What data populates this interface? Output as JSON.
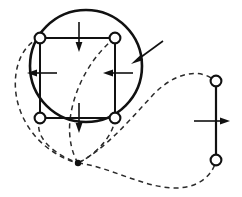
{
  "figure": {
    "canvas": {
      "width": 242,
      "height": 197,
      "background": "#ffffff"
    },
    "colors": {
      "solid_line": "#111111",
      "dashed_line": "#2b2b2b",
      "node_fill": "#ffffff",
      "junction": "#111111"
    },
    "left_assembly": {
      "label": "four-bar square linkage inside circle",
      "circle": {
        "cx": 86,
        "cy": 66,
        "r": 56,
        "stroke_width": 2.6
      },
      "square": {
        "x": 40,
        "y": 38,
        "width": 75,
        "height": 80,
        "stroke_width": 2.0
      },
      "nodes": [
        {
          "name": "top-left",
          "cx": 40,
          "cy": 38,
          "r": 5.4
        },
        {
          "name": "top-right",
          "cx": 115,
          "cy": 38,
          "r": 5.4
        },
        {
          "name": "bottom-left",
          "cx": 40,
          "cy": 118,
          "r": 5.4
        },
        {
          "name": "bottom-right",
          "cx": 115,
          "cy": 118,
          "r": 5.4
        }
      ],
      "force_arrows": [
        {
          "name": "top-vertical-down",
          "direction": "down",
          "x1": 79,
          "y1": 22,
          "x2": 79,
          "y2": 51
        },
        {
          "name": "bottom-vertical-down",
          "direction": "down",
          "x1": 79,
          "y1": 103,
          "x2": 79,
          "y2": 132
        },
        {
          "name": "left-horizontal-left",
          "direction": "left",
          "x1": 57,
          "y1": 73,
          "x2": 28,
          "y2": 73
        },
        {
          "name": "right-horizontal-left",
          "direction": "left",
          "x1": 133,
          "y1": 73,
          "x2": 104,
          "y2": 73
        }
      ],
      "tick_marks": [
        {
          "name": "top-arrow-tick",
          "orientation": "horizontal",
          "cx": 79,
          "cy": 38,
          "len": 30
        },
        {
          "name": "bottom-arrow-tick",
          "orientation": "horizontal",
          "cx": 79,
          "cy": 118,
          "len": 30
        },
        {
          "name": "left-arrow-tick",
          "orientation": "vertical",
          "cx": 40,
          "cy": 73,
          "len": 28
        },
        {
          "name": "right-arrow-tick",
          "orientation": "vertical",
          "cx": 115,
          "cy": 73,
          "len": 28
        }
      ],
      "leader_arrow": {
        "name": "circle-leader-arrow",
        "direction": "down-left",
        "x1": 163,
        "y1": 41,
        "x2": 132,
        "y2": 63
      }
    },
    "right_assembly": {
      "label": "two-node vertical link",
      "link": {
        "x": 216,
        "y1": 81,
        "y2": 160,
        "stroke_width": 2.0
      },
      "nodes": [
        {
          "name": "upper",
          "cx": 216,
          "cy": 81,
          "r": 5.4
        },
        {
          "name": "lower",
          "cx": 216,
          "cy": 160,
          "r": 5.4
        }
      ],
      "force_arrow": {
        "name": "link-horizontal-right",
        "direction": "right",
        "x1": 194,
        "y1": 121,
        "x2": 229,
        "y2": 121
      },
      "tick_mark": {
        "name": "link-arrow-tick",
        "orientation": "vertical",
        "cx": 216,
        "cy": 121,
        "len": 28
      }
    },
    "junction_point": {
      "name": "trajectory-convergence",
      "cx": 78,
      "cy": 163,
      "r": 3.2
    },
    "trajectories": [
      {
        "name": "outer-left-sweep",
        "style": "dashed"
      },
      {
        "name": "inner-left-sweep",
        "style": "dashed"
      },
      {
        "name": "center-vertical-sweep",
        "style": "dashed"
      },
      {
        "name": "bottom-right-node-sweep",
        "style": "dashed"
      },
      {
        "name": "long-right-loop-upper",
        "style": "dashed"
      },
      {
        "name": "long-right-loop-lower",
        "style": "dashed"
      }
    ]
  }
}
